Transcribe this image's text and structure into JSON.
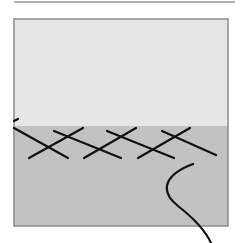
{
  "diagram": {
    "colors": {
      "background": "#ffffff",
      "top_rule": "#9a9a9a",
      "box_border": "#8c8c8c",
      "upper_region": "#e6e6e6",
      "lower_region": "#c2c2c2",
      "stroke": "#111111"
    },
    "top_rule": {
      "x1": 14,
      "y1": 2,
      "x2": 235,
      "y2": 2
    },
    "box": {
      "x": 14,
      "y": 19,
      "width": 214,
      "height": 207
    },
    "boundary_y": 126,
    "zigzag_segments": [
      {
        "x1": 14,
        "y1": 121,
        "x2": 18,
        "y2": 119
      },
      {
        "x1": 14,
        "y1": 128,
        "x2": 68,
        "y2": 158
      },
      {
        "x1": 29,
        "y1": 158,
        "x2": 83,
        "y2": 128
      },
      {
        "x1": 54,
        "y1": 131,
        "x2": 121,
        "y2": 158
      },
      {
        "x1": 84,
        "y1": 158,
        "x2": 136,
        "y2": 128
      },
      {
        "x1": 107,
        "y1": 131,
        "x2": 174,
        "y2": 158
      },
      {
        "x1": 138,
        "y1": 158,
        "x2": 190,
        "y2": 128
      },
      {
        "x1": 162,
        "y1": 131,
        "x2": 216,
        "y2": 155
      }
    ],
    "curve": {
      "d": "M 193 164 C 166 174, 158 190, 178 206 C 196 220, 206 232, 211 243"
    }
  }
}
